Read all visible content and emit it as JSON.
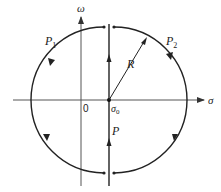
{
  "diagram": {
    "title": "",
    "axes": {
      "horizontal_label": "σ",
      "vertical_label": "ω",
      "origin_label": "0"
    },
    "center_label": "σ",
    "center_subscript": "0",
    "radius_label": "R",
    "path_labels": {
      "p1": "P",
      "p1_sub": "1",
      "p2": "P",
      "p2_sub": "2",
      "p": "P"
    },
    "colors": {
      "stroke": "#222222",
      "axis": "#555555",
      "background": "#ffffff"
    }
  }
}
